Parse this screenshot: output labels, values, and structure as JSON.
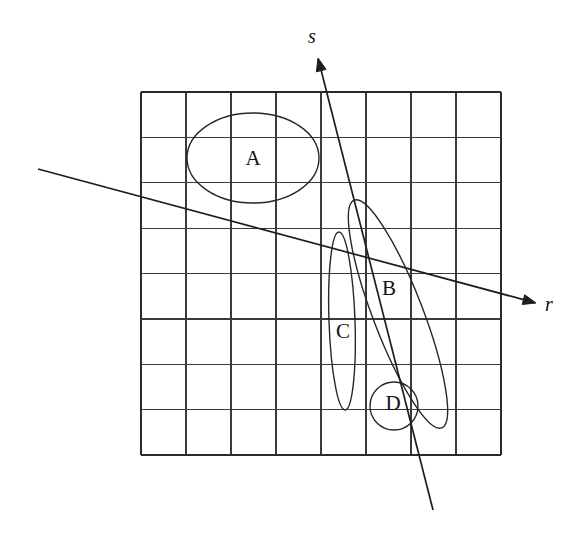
{
  "figure": {
    "background_color": "#ffffff",
    "line_color": "#272727",
    "grid_color": "#3a3a3a",
    "width": 588,
    "height": 538
  },
  "grid": {
    "name": "square-grid",
    "columns": 8,
    "rows": 8,
    "left": 141,
    "top": 92,
    "right": 501,
    "bottom": 455,
    "cell_width": 45,
    "cell_height": 45.4,
    "vertical_lines_x": [
      141,
      186,
      231,
      276,
      321,
      366,
      411,
      456,
      501
    ],
    "horizontal_lines_y": [
      92,
      137.4,
      182.8,
      228.2,
      273.6,
      319,
      364.4,
      409.8,
      455
    ]
  },
  "axes": [
    {
      "id": "s",
      "label": "s",
      "label_x": 312,
      "label_y": 38,
      "tip_x": 318,
      "tip_y": 58,
      "tail_x": 433,
      "tail_y": 510,
      "arrow": "tip"
    },
    {
      "id": "r",
      "label": "r",
      "label_x": 549,
      "label_y": 306,
      "tip_x": 536,
      "tip_y": 303,
      "tail_x": 38,
      "tail_y": 169,
      "arrow": "tip"
    }
  ],
  "regions": [
    {
      "id": "A",
      "label": "A",
      "shape": "ellipse",
      "cx": 253,
      "cy": 158,
      "rx": 66,
      "ry": 45,
      "rotation": 0,
      "label_x": 253,
      "label_y": 160
    },
    {
      "id": "B",
      "label": "B",
      "shape": "ellipse",
      "cx": 398,
      "cy": 314,
      "rx": 25,
      "ry": 122,
      "rotation": -21,
      "label_x": 389,
      "label_y": 290
    },
    {
      "id": "C",
      "label": "C",
      "shape": "ellipse",
      "cx": 342,
      "cy": 321,
      "rx": 13,
      "ry": 89,
      "rotation": -2,
      "label_x": 343,
      "label_y": 333
    },
    {
      "id": "D",
      "label": "D",
      "shape": "circle",
      "cx": 394,
      "cy": 406,
      "rx": 24,
      "ry": 24,
      "rotation": 0,
      "label_x": 393,
      "label_y": 405
    }
  ]
}
